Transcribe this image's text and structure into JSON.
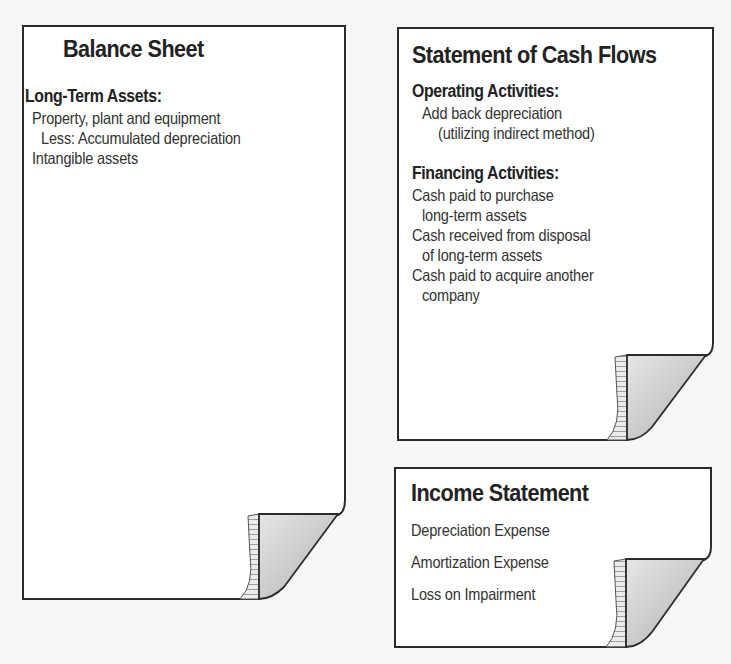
{
  "colors": {
    "border": "#2b2b2b",
    "paper": "#ffffff",
    "background": "#f7f7f5",
    "curl_shade": "#bdbdbd",
    "curl_stripes": "#d8d8d8"
  },
  "balance_sheet": {
    "title": "Balance Sheet",
    "section_heading": "Long-Term Assets:",
    "items": [
      "Property, plant and equipment",
      "Less: Accumulated depreciation",
      "Intangible assets"
    ]
  },
  "cash_flows": {
    "title": "Statement of Cash Flows",
    "operating_heading": "Operating Activities:",
    "operating_items": [
      "Add back depreciation",
      "(utilizing indirect method)"
    ],
    "financing_heading": "Financing Activities:",
    "financing_items": [
      "Cash paid to purchase",
      "long-term assets",
      "Cash received from disposal",
      "of long-term assets",
      "Cash paid to acquire another",
      "company"
    ]
  },
  "income_statement": {
    "title": "Income Statement",
    "items": [
      "Depreciation Expense",
      "Amortization Expense",
      "Loss on Impairment"
    ]
  }
}
